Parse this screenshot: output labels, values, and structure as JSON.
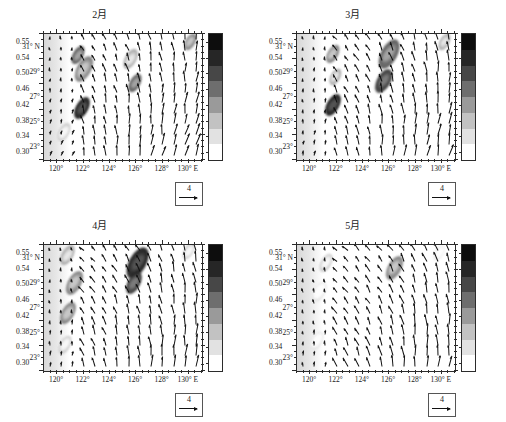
{
  "figure": {
    "panel_count": 4,
    "layout": "2x2",
    "colorbar_levels": [
      "0.55",
      "0.54",
      "0.50",
      "0.46",
      "0.42",
      "0.38",
      "0.34",
      "0.30"
    ],
    "colorbar_colors": [
      "#0d0d0d",
      "#262626",
      "#474747",
      "#6e6e6e",
      "#9a9a9a",
      "#c2c2c2",
      "#e2e2e2",
      "#ffffff"
    ],
    "vector_key_label": "4",
    "x_ticks": [
      "120°",
      "122°",
      "124°",
      "126°",
      "128°",
      "130° E"
    ],
    "y_ticks": [
      "31° N",
      "29°",
      "27°",
      "25°",
      "23°"
    ],
    "x_range": [
      119.0,
      131.0
    ],
    "y_range": [
      22.0,
      32.0
    ]
  },
  "panels": [
    {
      "id": "panel-feb",
      "title": "2月"
    },
    {
      "id": "panel-mar",
      "title": "3月"
    },
    {
      "id": "panel-apr",
      "title": "4月"
    },
    {
      "id": "panel-may",
      "title": "5月"
    }
  ],
  "chart_data": {
    "type": "heatmap",
    "title": "",
    "xlabel": "",
    "ylabel": "",
    "xlim": [
      119.0,
      131.0
    ],
    "ylim": [
      22.0,
      32.0
    ],
    "grid": false,
    "legend": "colorbar-right",
    "colorbar": {
      "ticks": [
        0.55,
        0.54,
        0.5,
        0.46,
        0.42,
        0.38,
        0.34,
        0.3
      ],
      "vmin": 0.3,
      "vmax": 0.55
    },
    "vector_scale": {
      "value": 4,
      "label": "4"
    },
    "series": [
      {
        "name": "2月",
        "x_ticks": [
          120,
          122,
          124,
          126,
          128,
          130
        ],
        "y_ticks": [
          31,
          29,
          27,
          25,
          23
        ],
        "patches": [
          {
            "lon": 121.6,
            "lat": 30.3,
            "value": 0.5,
            "size": 10
          },
          {
            "lon": 122.0,
            "lat": 29.2,
            "value": 0.46,
            "size": 14
          },
          {
            "lon": 121.9,
            "lat": 26.1,
            "value": 0.55,
            "size": 12
          },
          {
            "lon": 125.6,
            "lat": 30.0,
            "value": 0.42,
            "size": 11
          },
          {
            "lon": 125.9,
            "lat": 28.1,
            "value": 0.5,
            "size": 10
          },
          {
            "lon": 130.1,
            "lat": 31.4,
            "value": 0.46,
            "size": 9
          },
          {
            "lon": 120.5,
            "lat": 24.2,
            "value": 0.38,
            "size": 10
          }
        ],
        "mean_flow_direction_deg": 260,
        "description": "Southward coastal flow; strong nearshore turbidity maxima off Zhejiang and Fujian."
      },
      {
        "name": "3月",
        "x_ticks": [
          120,
          122,
          124,
          126,
          128,
          130
        ],
        "y_ticks": [
          31,
          29,
          27,
          25,
          23
        ],
        "patches": [
          {
            "lon": 121.7,
            "lat": 30.4,
            "value": 0.46,
            "size": 10
          },
          {
            "lon": 121.9,
            "lat": 28.6,
            "value": 0.42,
            "size": 9
          },
          {
            "lon": 121.7,
            "lat": 26.4,
            "value": 0.55,
            "size": 12
          },
          {
            "lon": 126.0,
            "lat": 30.4,
            "value": 0.5,
            "size": 16
          },
          {
            "lon": 125.6,
            "lat": 28.3,
            "value": 0.54,
            "size": 13
          },
          {
            "lon": 130.2,
            "lat": 31.4,
            "value": 0.42,
            "size": 9
          }
        ],
        "mean_flow_direction_deg": 255,
        "description": "Intensified offshore band near 126°E; persistent southward drift."
      },
      {
        "name": "4月",
        "x_ticks": [
          120,
          122,
          124,
          126,
          128,
          130
        ],
        "y_ticks": [
          31,
          29,
          27,
          25,
          23
        ],
        "patches": [
          {
            "lon": 120.8,
            "lat": 31.2,
            "value": 0.42,
            "size": 11
          },
          {
            "lon": 121.3,
            "lat": 29.0,
            "value": 0.46,
            "size": 13
          },
          {
            "lon": 120.8,
            "lat": 26.6,
            "value": 0.46,
            "size": 12
          },
          {
            "lon": 126.1,
            "lat": 30.6,
            "value": 0.55,
            "size": 17
          },
          {
            "lon": 125.8,
            "lat": 29.0,
            "value": 0.54,
            "size": 12
          },
          {
            "lon": 120.6,
            "lat": 24.1,
            "value": 0.38,
            "size": 10
          },
          {
            "lon": 130.0,
            "lat": 31.5,
            "value": 0.38,
            "size": 9
          }
        ],
        "mean_flow_direction_deg": 250,
        "description": "Strongest central band; southwestward vectors dominate interior."
      },
      {
        "name": "5月",
        "x_ticks": [
          120,
          122,
          124,
          126,
          128,
          130
        ],
        "y_ticks": [
          31,
          29,
          27,
          25,
          23
        ],
        "patches": [
          {
            "lon": 121.2,
            "lat": 30.6,
            "value": 0.38,
            "size": 10
          },
          {
            "lon": 120.7,
            "lat": 28.3,
            "value": 0.34,
            "size": 11
          },
          {
            "lon": 126.4,
            "lat": 30.2,
            "value": 0.46,
            "size": 13
          },
          {
            "lon": 120.5,
            "lat": 24.4,
            "value": 0.34,
            "size": 10
          },
          {
            "lon": 129.8,
            "lat": 31.4,
            "value": 0.34,
            "size": 8
          }
        ],
        "mean_flow_direction_deg": 245,
        "description": "Weakened patches; flow turns more southwestward across the shelf."
      }
    ]
  }
}
